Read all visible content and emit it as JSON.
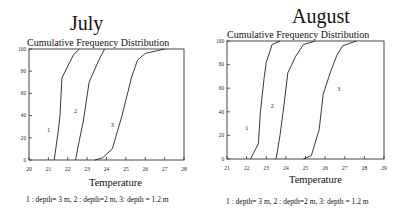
{
  "chart_data": [
    {
      "type": "line",
      "panel": "July",
      "title": "Cumulative Frequency Distribution",
      "xlabel": "Temperature",
      "ylabel": "",
      "xlim": [
        20,
        28
      ],
      "ylim": [
        0,
        100
      ],
      "xticks": [
        20,
        21,
        22,
        23,
        24,
        25,
        26,
        27,
        28
      ],
      "yticks": [
        0,
        20,
        40,
        60,
        80,
        100
      ],
      "grid": false,
      "series": [
        {
          "name": "1",
          "label_pos": [
            21.0,
            25
          ],
          "x": [
            21.3,
            21.5,
            21.6,
            21.7,
            22.3,
            22.6
          ],
          "y": [
            0,
            25,
            40,
            74,
            95,
            100
          ]
        },
        {
          "name": "2",
          "label_pos": [
            22.4,
            42
          ],
          "x": [
            22.4,
            22.6,
            22.8,
            23.1,
            23.6,
            23.9
          ],
          "y": [
            0,
            18,
            35,
            70,
            90,
            100
          ]
        },
        {
          "name": "3",
          "label_pos": [
            24.3,
            30
          ],
          "x": [
            23.4,
            23.8,
            24.3,
            24.8,
            25.3,
            25.6,
            26.0,
            27.0
          ],
          "y": [
            0,
            2,
            10,
            40,
            75,
            90,
            96,
            100
          ]
        }
      ]
    },
    {
      "type": "line",
      "panel": "August",
      "title": "Cumulative Frequency Distribution",
      "xlabel": "Temperature",
      "ylabel": "",
      "xlim": [
        21,
        29
      ],
      "ylim": [
        0,
        100
      ],
      "xticks": [
        21,
        22,
        23,
        24,
        25,
        26,
        27,
        28,
        29
      ],
      "yticks": [
        0,
        20,
        40,
        60,
        80,
        100
      ],
      "grid": false,
      "series": [
        {
          "name": "1",
          "label_pos": [
            22.0,
            25
          ],
          "x": [
            22.2,
            22.6,
            22.7,
            22.9,
            23.0,
            23.3,
            23.7
          ],
          "y": [
            0,
            13,
            40,
            70,
            82,
            97,
            100
          ]
        },
        {
          "name": "2",
          "label_pos": [
            23.3,
            43
          ],
          "x": [
            23.5,
            23.7,
            23.9,
            24.1,
            24.5,
            24.9,
            25.5
          ],
          "y": [
            0,
            20,
            45,
            73,
            87,
            97,
            100
          ]
        },
        {
          "name": "3",
          "label_pos": [
            26.7,
            58
          ],
          "x": [
            24.9,
            25.3,
            25.7,
            25.9,
            26.3,
            26.6,
            26.9,
            27.6
          ],
          "y": [
            0,
            3,
            25,
            55,
            75,
            88,
            96,
            100
          ]
        }
      ]
    }
  ],
  "july": {
    "month_title": "July",
    "chart_title": "Cumulative Frequency Distribution",
    "xlabel": "Temperature",
    "caption": "1 : depth= 3 m, 2 : depth=2  m, 3: depth = 1.2  m"
  },
  "august": {
    "month_title": "August",
    "chart_title": "Cumulative Frequency Distribution",
    "xlabel": "Temperature",
    "caption": "1 : depth= 3 m, 2 : depth=2  m, 3: depth = 1.2  m"
  }
}
